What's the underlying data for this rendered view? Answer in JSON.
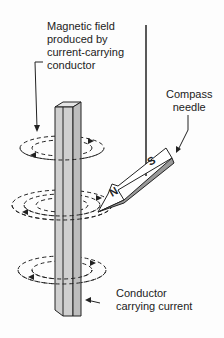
{
  "labels": {
    "field": [
      "Magnetic field",
      "produced by",
      "current-carrying",
      "conductor"
    ],
    "compass": [
      "Compass",
      "needle"
    ],
    "conductor": [
      "Conductor",
      "carrying current"
    ]
  },
  "needle": {
    "north": "N",
    "south": "S"
  },
  "colors": {
    "ink": "#222222",
    "conductor_fill": "#c8c8c8",
    "conductor_side": "#dedede",
    "background": "#fdfdfd"
  }
}
